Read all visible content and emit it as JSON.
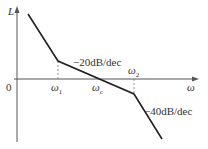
{
  "diagram": {
    "type": "bode-magnitude-asymptotic",
    "axes": {
      "y_label": "L",
      "x_label": "ω",
      "origin_label": "0"
    },
    "breakpoints": [
      {
        "symbol": "ω",
        "sub": "1"
      },
      {
        "symbol": "ω",
        "sub": "c"
      },
      {
        "symbol": "ω",
        "sub": "2"
      }
    ],
    "slopes": [
      {
        "label": "−20dB/dec"
      },
      {
        "label": "−40dB/dec"
      }
    ],
    "colors": {
      "line": "#222222",
      "axis": "#555555",
      "dashed": "#777777"
    }
  }
}
